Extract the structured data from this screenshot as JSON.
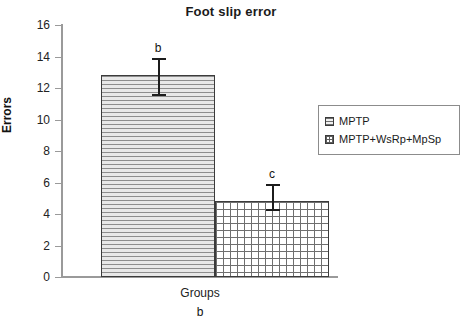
{
  "chart_data": {
    "type": "bar",
    "title": "Foot slip error",
    "xlabel": "Groups",
    "ylabel": "Errors",
    "categories": [
      "MPTP",
      "MPTP+WsRp+MpSp"
    ],
    "values": [
      12.8,
      4.85
    ],
    "errors_upper": [
      13.9,
      5.9
    ],
    "errors_lower": [
      11.5,
      4.2
    ],
    "point_labels": [
      "b",
      "c"
    ],
    "ylim": [
      0,
      16
    ],
    "yticks": [
      0,
      2,
      4,
      6,
      8,
      10,
      12,
      14,
      16
    ],
    "ytick_labels": [
      "0",
      "2",
      "4",
      "6",
      "8",
      "10",
      "12",
      "14",
      "16"
    ],
    "grid": false,
    "legend_position": "right",
    "legend": [
      {
        "label": "MPTP",
        "pattern": "horizontal-lines"
      },
      {
        "label": "MPTP+WsRp+MpSp",
        "pattern": "grid"
      }
    ],
    "caption": "b"
  },
  "colors": {
    "axis": "#9a9a9a",
    "bar_outline": "#3b3b3b",
    "error_bar": "#1c1c1c",
    "text": "#1a1a1a",
    "legend_border": "#8c8c8c",
    "background": "#ffffff"
  }
}
